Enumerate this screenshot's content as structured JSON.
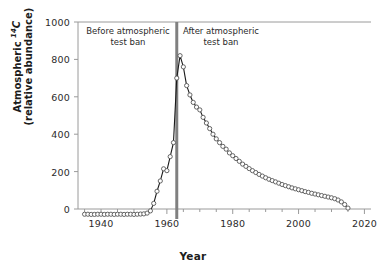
{
  "chart_data": {
    "type": "line",
    "title": "",
    "xlabel": "Year",
    "ylabel_line1": "Atmospheric ¹⁴C",
    "ylabel_line2": "(relative abundance)",
    "xlim": [
      1933,
      2022
    ],
    "ylim": [
      -60,
      1000
    ],
    "xticks": [
      1940,
      1960,
      1980,
      2000,
      2020
    ],
    "yticks": [
      0,
      200,
      400,
      600,
      800,
      1000
    ],
    "grid": false,
    "legend": "none",
    "marker": "open-circle",
    "line_color": "#1a1a1a",
    "marker_edge_color": "#555555",
    "marker_face_color": "#ffffff",
    "annotations": [
      {
        "name": "before-test-ban",
        "line1": "Before atmospheric",
        "line2": "test ban",
        "x": 1949
      },
      {
        "name": "after-test-ban",
        "line1": "After atmospheric",
        "line2": "test ban",
        "x": 1975
      }
    ],
    "vline": {
      "name": "atmospheric-test-ban-line",
      "x": 1963,
      "color": "#808080",
      "width": 3
    },
    "series": [
      {
        "name": "Atmospheric 14C relative abundance",
        "x": [
          1935,
          1936,
          1937,
          1938,
          1939,
          1940,
          1941,
          1942,
          1943,
          1944,
          1945,
          1946,
          1947,
          1948,
          1949,
          1950,
          1951,
          1952,
          1953,
          1954,
          1955,
          1956,
          1957,
          1958,
          1959,
          1960,
          1961,
          1962,
          1963,
          1964,
          1965,
          1966,
          1967,
          1968,
          1969,
          1970,
          1971,
          1972,
          1973,
          1974,
          1975,
          1976,
          1977,
          1978,
          1979,
          1980,
          1981,
          1982,
          1983,
          1984,
          1985,
          1986,
          1987,
          1988,
          1989,
          1990,
          1991,
          1992,
          1993,
          1994,
          1995,
          1996,
          1997,
          1998,
          1999,
          2000,
          2001,
          2002,
          2003,
          2004,
          2005,
          2006,
          2007,
          2008,
          2009,
          2010,
          2011,
          2012,
          2013,
          2014,
          2015
        ],
        "values": [
          -28,
          -28,
          -29,
          -29,
          -28,
          -28,
          -29,
          -28,
          -28,
          -29,
          -28,
          -28,
          -29,
          -28,
          -28,
          -29,
          -28,
          -27,
          -26,
          -22,
          -10,
          30,
          95,
          150,
          215,
          205,
          280,
          355,
          700,
          820,
          760,
          660,
          610,
          570,
          545,
          530,
          490,
          460,
          430,
          400,
          375,
          355,
          335,
          320,
          300,
          285,
          270,
          255,
          240,
          228,
          216,
          205,
          195,
          185,
          176,
          167,
          159,
          152,
          145,
          138,
          131,
          125,
          119,
          113,
          108,
          103,
          98,
          93,
          89,
          84,
          80,
          76,
          72,
          68,
          64,
          60,
          55,
          48,
          38,
          24,
          5
        ]
      }
    ]
  },
  "axis": {
    "xtick_labels": [
      "1940",
      "1960",
      "1980",
      "2000",
      "2020"
    ],
    "ytick_labels": [
      "0",
      "200",
      "400",
      "600",
      "800",
      "1000"
    ]
  }
}
